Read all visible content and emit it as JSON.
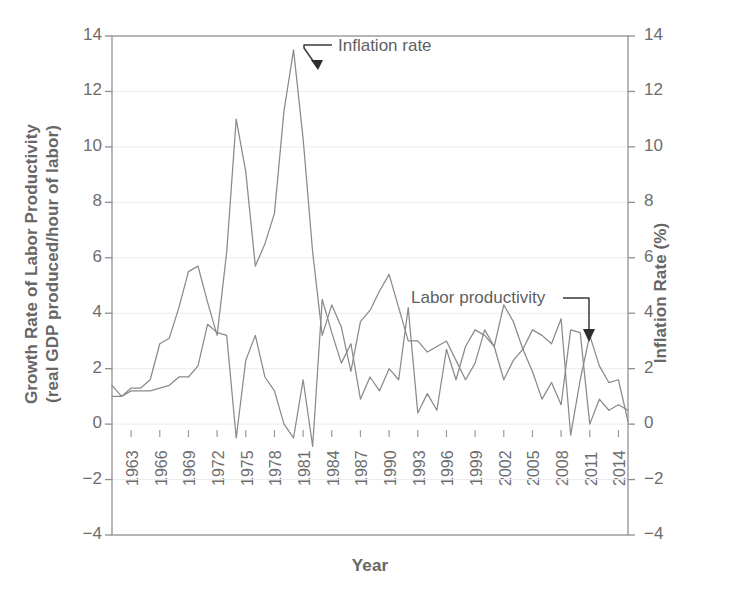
{
  "chart_data": {
    "type": "line",
    "title": "",
    "xlabel": "Year",
    "ylabel": "Growth Rate of Labor Productivity (real GDP produced/hour of labor)",
    "ylabel_line1": "Growth Rate of Labor Productivity",
    "ylabel_line2": "(real GDP produced/hour of labor)",
    "y2label": "Inflation Rate (%)",
    "xlim": [
      1961,
      2015
    ],
    "ylim": [
      -4,
      14
    ],
    "y2lim": [
      -4,
      14
    ],
    "yticks": [
      14,
      12,
      10,
      8,
      6,
      4,
      2,
      0,
      -2,
      -4
    ],
    "yticklabels": [
      "14",
      "12",
      "10",
      "8",
      "6",
      "4",
      "2",
      "0",
      "−2",
      "−4"
    ],
    "y2ticks": [
      14,
      12,
      10,
      8,
      6,
      4,
      2,
      0,
      -2,
      -4
    ],
    "y2ticklabels": [
      "14",
      "12",
      "10",
      "8",
      "6",
      "4",
      "2",
      "0",
      "−2",
      "−4"
    ],
    "xticks": [
      1963,
      1966,
      1969,
      1972,
      1975,
      1978,
      1981,
      1984,
      1987,
      1990,
      1993,
      1996,
      1999,
      2002,
      2005,
      2008,
      2011,
      2014
    ],
    "xticklabels": [
      "1963",
      "1966",
      "1969",
      "1972",
      "1975",
      "1978",
      "1981",
      "1984",
      "1987",
      "1990",
      "1993",
      "1996",
      "1999",
      "2002",
      "2005",
      "2008",
      "2011",
      "2014"
    ],
    "grid": true,
    "grid_axis": "y",
    "legend": "annotations",
    "line_color": "#8a8a8a",
    "annotations": [
      {
        "text": "Inflation rate",
        "target_year": 1980,
        "target_value": 12.3
      },
      {
        "text": "Labor productivity",
        "target_year": 2010,
        "target_value": 3.3
      }
    ],
    "x": [
      1961,
      1962,
      1963,
      1964,
      1965,
      1966,
      1967,
      1968,
      1969,
      1970,
      1971,
      1972,
      1973,
      1974,
      1975,
      1976,
      1977,
      1978,
      1979,
      1980,
      1981,
      1982,
      1983,
      1984,
      1985,
      1986,
      1987,
      1988,
      1989,
      1990,
      1991,
      1992,
      1993,
      1994,
      1995,
      1996,
      1997,
      1998,
      1999,
      2000,
      2001,
      2002,
      2003,
      2004,
      2005,
      2006,
      2007,
      2008,
      2009,
      2010,
      2011,
      2012,
      2013,
      2014,
      2015
    ],
    "series": [
      {
        "name": "Labor productivity",
        "axis": "left",
        "values": [
          1.4,
          1.0,
          1.2,
          1.2,
          1.2,
          1.3,
          1.4,
          1.7,
          1.7,
          2.1,
          3.6,
          3.3,
          3.2,
          -0.5,
          2.3,
          3.2,
          1.7,
          1.2,
          0.0,
          -0.5,
          1.6,
          -0.8,
          4.5,
          3.3,
          2.2,
          2.9,
          0.9,
          1.7,
          1.2,
          2.0,
          1.6,
          4.2,
          0.4,
          1.1,
          0.5,
          2.7,
          1.6,
          2.8,
          3.4,
          3.2,
          2.8,
          4.3,
          3.7,
          2.7,
          1.9,
          0.9,
          1.5,
          0.7,
          3.4,
          3.3,
          0.0,
          0.9,
          0.5,
          0.7,
          0.5
        ]
      },
      {
        "name": "Inflation rate",
        "axis": "right",
        "values": [
          1.0,
          1.0,
          1.3,
          1.3,
          1.6,
          2.9,
          3.1,
          4.2,
          5.5,
          5.7,
          4.4,
          3.2,
          6.2,
          11.0,
          9.1,
          5.7,
          6.5,
          7.6,
          11.3,
          13.5,
          10.3,
          6.2,
          3.2,
          4.3,
          3.5,
          1.9,
          3.7,
          4.1,
          4.8,
          5.4,
          4.2,
          3.0,
          3.0,
          2.6,
          2.8,
          3.0,
          2.3,
          1.6,
          2.2,
          3.4,
          2.8,
          1.6,
          2.3,
          2.7,
          3.4,
          3.2,
          2.9,
          3.8,
          -0.4,
          1.6,
          3.2,
          2.1,
          1.5,
          1.6,
          0.1
        ]
      }
    ]
  },
  "annotations": {
    "inflation_label": "Inflation rate",
    "productivity_label": "Labor productivity"
  },
  "axes": {
    "x_title": "Year",
    "y_left_line1": "Growth Rate of Labor Productivity",
    "y_left_line2": "(real GDP produced/hour of labor)",
    "y_right_title": "Inflation Rate (%)"
  }
}
